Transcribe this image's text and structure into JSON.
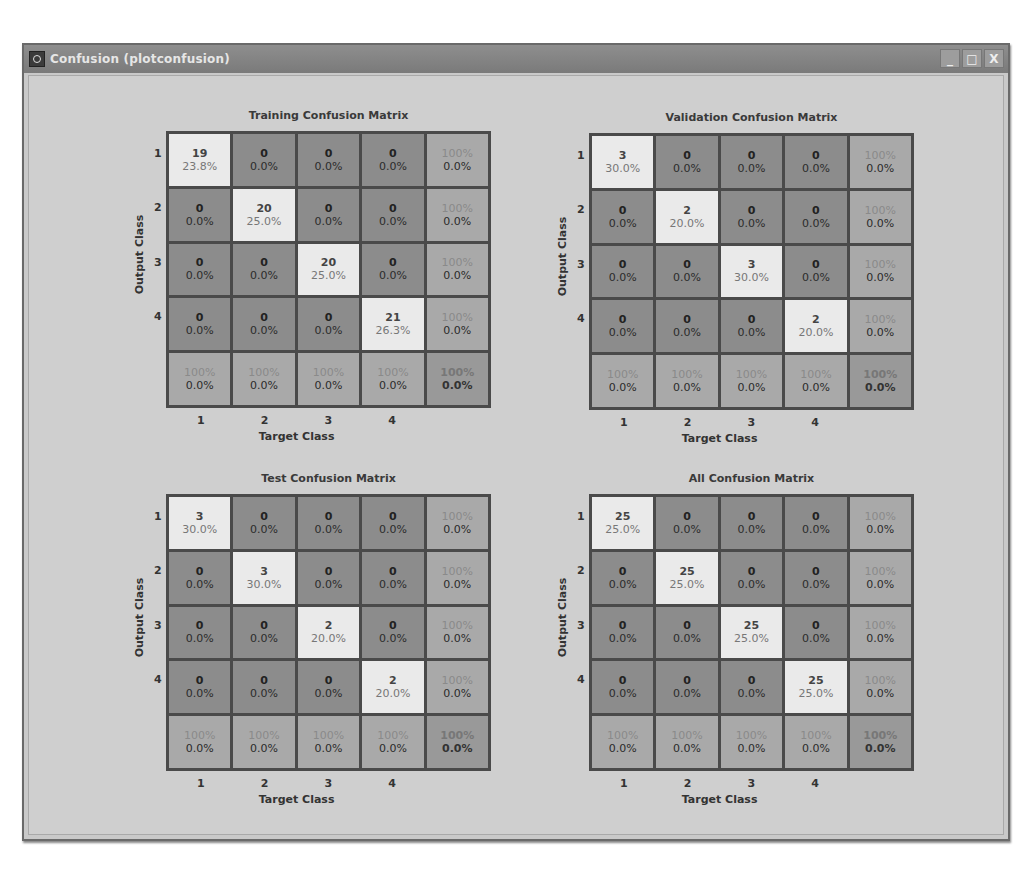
{
  "window": {
    "title": "Confusion (plotconfusion)",
    "controls": {
      "minimize": "_",
      "maximize": "□",
      "close": "X"
    }
  },
  "labels": {
    "ylabel": "Output Class",
    "xlabel": "Target Class",
    "row_ticks": [
      "1",
      "2",
      "3",
      "4"
    ],
    "col_ticks": [
      "1",
      "2",
      "3",
      "4"
    ]
  },
  "panels": [
    {
      "title": "Training Confusion Matrix",
      "cells": [
        [
          {
            "n": "19",
            "p": "23.8%"
          },
          {
            "n": "0",
            "p": "0.0%"
          },
          {
            "n": "0",
            "p": "0.0%"
          },
          {
            "n": "0",
            "p": "0.0%"
          },
          {
            "n": "100%",
            "p": "0.0%"
          }
        ],
        [
          {
            "n": "0",
            "p": "0.0%"
          },
          {
            "n": "20",
            "p": "25.0%"
          },
          {
            "n": "0",
            "p": "0.0%"
          },
          {
            "n": "0",
            "p": "0.0%"
          },
          {
            "n": "100%",
            "p": "0.0%"
          }
        ],
        [
          {
            "n": "0",
            "p": "0.0%"
          },
          {
            "n": "0",
            "p": "0.0%"
          },
          {
            "n": "20",
            "p": "25.0%"
          },
          {
            "n": "0",
            "p": "0.0%"
          },
          {
            "n": "100%",
            "p": "0.0%"
          }
        ],
        [
          {
            "n": "0",
            "p": "0.0%"
          },
          {
            "n": "0",
            "p": "0.0%"
          },
          {
            "n": "0",
            "p": "0.0%"
          },
          {
            "n": "21",
            "p": "26.3%"
          },
          {
            "n": "100%",
            "p": "0.0%"
          }
        ],
        [
          {
            "n": "100%",
            "p": "0.0%"
          },
          {
            "n": "100%",
            "p": "0.0%"
          },
          {
            "n": "100%",
            "p": "0.0%"
          },
          {
            "n": "100%",
            "p": "0.0%"
          },
          {
            "n": "100%",
            "p": "0.0%"
          }
        ]
      ]
    },
    {
      "title": "Validation Confusion Matrix",
      "cells": [
        [
          {
            "n": "3",
            "p": "30.0%"
          },
          {
            "n": "0",
            "p": "0.0%"
          },
          {
            "n": "0",
            "p": "0.0%"
          },
          {
            "n": "0",
            "p": "0.0%"
          },
          {
            "n": "100%",
            "p": "0.0%"
          }
        ],
        [
          {
            "n": "0",
            "p": "0.0%"
          },
          {
            "n": "2",
            "p": "20.0%"
          },
          {
            "n": "0",
            "p": "0.0%"
          },
          {
            "n": "0",
            "p": "0.0%"
          },
          {
            "n": "100%",
            "p": "0.0%"
          }
        ],
        [
          {
            "n": "0",
            "p": "0.0%"
          },
          {
            "n": "0",
            "p": "0.0%"
          },
          {
            "n": "3",
            "p": "30.0%"
          },
          {
            "n": "0",
            "p": "0.0%"
          },
          {
            "n": "100%",
            "p": "0.0%"
          }
        ],
        [
          {
            "n": "0",
            "p": "0.0%"
          },
          {
            "n": "0",
            "p": "0.0%"
          },
          {
            "n": "0",
            "p": "0.0%"
          },
          {
            "n": "2",
            "p": "20.0%"
          },
          {
            "n": "100%",
            "p": "0.0%"
          }
        ],
        [
          {
            "n": "100%",
            "p": "0.0%"
          },
          {
            "n": "100%",
            "p": "0.0%"
          },
          {
            "n": "100%",
            "p": "0.0%"
          },
          {
            "n": "100%",
            "p": "0.0%"
          },
          {
            "n": "100%",
            "p": "0.0%"
          }
        ]
      ]
    },
    {
      "title": "Test Confusion Matrix",
      "cells": [
        [
          {
            "n": "3",
            "p": "30.0%"
          },
          {
            "n": "0",
            "p": "0.0%"
          },
          {
            "n": "0",
            "p": "0.0%"
          },
          {
            "n": "0",
            "p": "0.0%"
          },
          {
            "n": "100%",
            "p": "0.0%"
          }
        ],
        [
          {
            "n": "0",
            "p": "0.0%"
          },
          {
            "n": "3",
            "p": "30.0%"
          },
          {
            "n": "0",
            "p": "0.0%"
          },
          {
            "n": "0",
            "p": "0.0%"
          },
          {
            "n": "100%",
            "p": "0.0%"
          }
        ],
        [
          {
            "n": "0",
            "p": "0.0%"
          },
          {
            "n": "0",
            "p": "0.0%"
          },
          {
            "n": "2",
            "p": "20.0%"
          },
          {
            "n": "0",
            "p": "0.0%"
          },
          {
            "n": "100%",
            "p": "0.0%"
          }
        ],
        [
          {
            "n": "0",
            "p": "0.0%"
          },
          {
            "n": "0",
            "p": "0.0%"
          },
          {
            "n": "0",
            "p": "0.0%"
          },
          {
            "n": "2",
            "p": "20.0%"
          },
          {
            "n": "100%",
            "p": "0.0%"
          }
        ],
        [
          {
            "n": "100%",
            "p": "0.0%"
          },
          {
            "n": "100%",
            "p": "0.0%"
          },
          {
            "n": "100%",
            "p": "0.0%"
          },
          {
            "n": "100%",
            "p": "0.0%"
          },
          {
            "n": "100%",
            "p": "0.0%"
          }
        ]
      ]
    },
    {
      "title": "All Confusion Matrix",
      "cells": [
        [
          {
            "n": "25",
            "p": "25.0%"
          },
          {
            "n": "0",
            "p": "0.0%"
          },
          {
            "n": "0",
            "p": "0.0%"
          },
          {
            "n": "0",
            "p": "0.0%"
          },
          {
            "n": "100%",
            "p": "0.0%"
          }
        ],
        [
          {
            "n": "0",
            "p": "0.0%"
          },
          {
            "n": "25",
            "p": "25.0%"
          },
          {
            "n": "0",
            "p": "0.0%"
          },
          {
            "n": "0",
            "p": "0.0%"
          },
          {
            "n": "100%",
            "p": "0.0%"
          }
        ],
        [
          {
            "n": "0",
            "p": "0.0%"
          },
          {
            "n": "0",
            "p": "0.0%"
          },
          {
            "n": "25",
            "p": "25.0%"
          },
          {
            "n": "0",
            "p": "0.0%"
          },
          {
            "n": "100%",
            "p": "0.0%"
          }
        ],
        [
          {
            "n": "0",
            "p": "0.0%"
          },
          {
            "n": "0",
            "p": "0.0%"
          },
          {
            "n": "0",
            "p": "0.0%"
          },
          {
            "n": "25",
            "p": "25.0%"
          },
          {
            "n": "100%",
            "p": "0.0%"
          }
        ],
        [
          {
            "n": "100%",
            "p": "0.0%"
          },
          {
            "n": "100%",
            "p": "0.0%"
          },
          {
            "n": "100%",
            "p": "0.0%"
          },
          {
            "n": "100%",
            "p": "0.0%"
          },
          {
            "n": "100%",
            "p": "0.0%"
          }
        ]
      ]
    }
  ],
  "colors": {
    "diagonal": "#eaeaea",
    "off_diagonal": "#8c8c8c",
    "summary": "#a9a9a9",
    "grid_line": "#4a4a4a",
    "window_bg": "#cfcfcf",
    "titlebar": "#858585"
  }
}
